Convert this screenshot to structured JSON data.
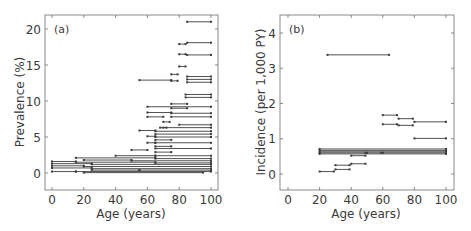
{
  "chart_data": [
    {
      "type": "line",
      "panel_label": "(a)",
      "title": "",
      "xlabel": "Age (years)",
      "ylabel": "Prevalence (%)",
      "xlim": [
        -3,
        104
      ],
      "ylim": [
        -2.2,
        21.8
      ],
      "xticks": [
        0,
        20,
        40,
        60,
        80,
        100
      ],
      "yticks": [
        0,
        5,
        10,
        15,
        20
      ],
      "grid": false,
      "legend": null,
      "description": "Horizontal interval segments (age range start to end) at prevalence values",
      "segments": [
        {
          "x0": 85,
          "x1": 100,
          "y": 21.0
        },
        {
          "x0": 80,
          "x1": 84,
          "y": 17.9
        },
        {
          "x0": 85,
          "x1": 100,
          "y": 18.1
        },
        {
          "x0": 80,
          "x1": 84,
          "y": 16.5
        },
        {
          "x0": 85,
          "x1": 100,
          "y": 16.4
        },
        {
          "x0": 80,
          "x1": 84,
          "y": 14.8
        },
        {
          "x0": 75,
          "x1": 79,
          "y": 13.7
        },
        {
          "x0": 55,
          "x1": 75,
          "y": 12.9
        },
        {
          "x0": 75,
          "x1": 79,
          "y": 12.8
        },
        {
          "x0": 85,
          "x1": 100,
          "y": 13.4
        },
        {
          "x0": 85,
          "x1": 100,
          "y": 13.0
        },
        {
          "x0": 85,
          "x1": 100,
          "y": 12.6
        },
        {
          "x0": 84,
          "x1": 100,
          "y": 10.9
        },
        {
          "x0": 84,
          "x1": 100,
          "y": 10.5
        },
        {
          "x0": 75,
          "x1": 85,
          "y": 9.6
        },
        {
          "x0": 60,
          "x1": 100,
          "y": 9.2
        },
        {
          "x0": 75,
          "x1": 85,
          "y": 9.0
        },
        {
          "x0": 60,
          "x1": 75,
          "y": 8.4
        },
        {
          "x0": 75,
          "x1": 100,
          "y": 8.3
        },
        {
          "x0": 60,
          "x1": 70,
          "y": 7.8
        },
        {
          "x0": 75,
          "x1": 100,
          "y": 7.8
        },
        {
          "x0": 70,
          "x1": 74,
          "y": 7.1
        },
        {
          "x0": 68,
          "x1": 72,
          "y": 6.3
        },
        {
          "x0": 80,
          "x1": 100,
          "y": 6.7
        },
        {
          "x0": 70,
          "x1": 100,
          "y": 6.3
        },
        {
          "x0": 55,
          "x1": 65,
          "y": 5.9
        },
        {
          "x0": 65,
          "x1": 100,
          "y": 5.8
        },
        {
          "x0": 65,
          "x1": 100,
          "y": 5.4
        },
        {
          "x0": 65,
          "x1": 100,
          "y": 5.0
        },
        {
          "x0": 60,
          "x1": 65,
          "y": 5.1
        },
        {
          "x0": 65,
          "x1": 75,
          "y": 4.6
        },
        {
          "x0": 60,
          "x1": 65,
          "y": 4.2
        },
        {
          "x0": 65,
          "x1": 100,
          "y": 4.2
        },
        {
          "x0": 65,
          "x1": 75,
          "y": 3.7
        },
        {
          "x0": 50,
          "x1": 60,
          "y": 3.2
        },
        {
          "x0": 65,
          "x1": 100,
          "y": 3.4
        },
        {
          "x0": 65,
          "x1": 75,
          "y": 2.9
        },
        {
          "x0": 40,
          "x1": 65,
          "y": 2.4
        },
        {
          "x0": 65,
          "x1": 100,
          "y": 2.4
        },
        {
          "x0": 15,
          "x1": 65,
          "y": 2.1
        },
        {
          "x0": 65,
          "x1": 100,
          "y": 2.0
        },
        {
          "x0": 20,
          "x1": 50,
          "y": 1.8
        },
        {
          "x0": 50,
          "x1": 100,
          "y": 1.7
        },
        {
          "x0": 0,
          "x1": 15,
          "y": 1.6
        },
        {
          "x0": 15,
          "x1": 65,
          "y": 1.5
        },
        {
          "x0": 65,
          "x1": 100,
          "y": 1.4
        },
        {
          "x0": 0,
          "x1": 25,
          "y": 1.3
        },
        {
          "x0": 25,
          "x1": 100,
          "y": 1.2
        },
        {
          "x0": 0,
          "x1": 20,
          "y": 1.0
        },
        {
          "x0": 20,
          "x1": 100,
          "y": 0.9
        },
        {
          "x0": 0,
          "x1": 25,
          "y": 0.7
        },
        {
          "x0": 25,
          "x1": 100,
          "y": 0.6
        },
        {
          "x0": 25,
          "x1": 55,
          "y": 0.4
        },
        {
          "x0": 55,
          "x1": 100,
          "y": 0.4
        },
        {
          "x0": 0,
          "x1": 15,
          "y": 0.2
        },
        {
          "x0": 15,
          "x1": 100,
          "y": 0.2
        },
        {
          "x0": 20,
          "x1": 95,
          "y": 0.05
        }
      ]
    },
    {
      "type": "line",
      "panel_label": "(b)",
      "title": "",
      "xlabel": "Age (years)",
      "ylabel": "Incidence (per 1,000 PY)",
      "xlim": [
        -3,
        104
      ],
      "ylim": [
        -0.45,
        4.5
      ],
      "xticks": [
        0,
        20,
        40,
        60,
        80,
        100
      ],
      "yticks": [
        0,
        1,
        2,
        3,
        4
      ],
      "grid": false,
      "legend": null,
      "description": "Horizontal interval segments (age range start to end) at incidence values",
      "segments": [
        {
          "x0": 25,
          "x1": 64,
          "y": 3.38
        },
        {
          "x0": 60,
          "x1": 69,
          "y": 1.67
        },
        {
          "x0": 70,
          "x1": 79,
          "y": 1.57
        },
        {
          "x0": 80,
          "x1": 100,
          "y": 1.48
        },
        {
          "x0": 60,
          "x1": 69,
          "y": 1.41
        },
        {
          "x0": 70,
          "x1": 79,
          "y": 1.38
        },
        {
          "x0": 80,
          "x1": 100,
          "y": 1.01
        },
        {
          "x0": 20,
          "x1": 100,
          "y": 0.71
        },
        {
          "x0": 20,
          "x1": 100,
          "y": 0.67
        },
        {
          "x0": 20,
          "x1": 100,
          "y": 0.63
        },
        {
          "x0": 20,
          "x1": 49,
          "y": 0.6
        },
        {
          "x0": 50,
          "x1": 59,
          "y": 0.6
        },
        {
          "x0": 60,
          "x1": 100,
          "y": 0.6
        },
        {
          "x0": 20,
          "x1": 100,
          "y": 0.57
        },
        {
          "x0": 40,
          "x1": 49,
          "y": 0.52
        },
        {
          "x0": 40,
          "x1": 49,
          "y": 0.29
        },
        {
          "x0": 30,
          "x1": 39,
          "y": 0.25
        },
        {
          "x0": 30,
          "x1": 39,
          "y": 0.13
        },
        {
          "x0": 20,
          "x1": 29,
          "y": 0.07
        }
      ]
    }
  ],
  "panels": [
    {
      "label": "(a)",
      "xlabel": "Age (years)",
      "ylabel": "Prevalence (%)",
      "xtick_labels": [
        "0",
        "20",
        "40",
        "60",
        "80",
        "100"
      ],
      "ytick_labels": [
        "0",
        "5",
        "10",
        "15",
        "20"
      ]
    },
    {
      "label": "(b)",
      "xlabel": "Age (years)",
      "ylabel": "Incidence (per 1,000 PY)",
      "xtick_labels": [
        "0",
        "20",
        "40",
        "60",
        "80",
        "100"
      ],
      "ytick_labels": [
        "0",
        "1",
        "2",
        "3",
        "4"
      ]
    }
  ],
  "colors": {
    "line": "#3c3c3c",
    "axis": "#6e6e6e",
    "text": "#3a3a3a"
  }
}
